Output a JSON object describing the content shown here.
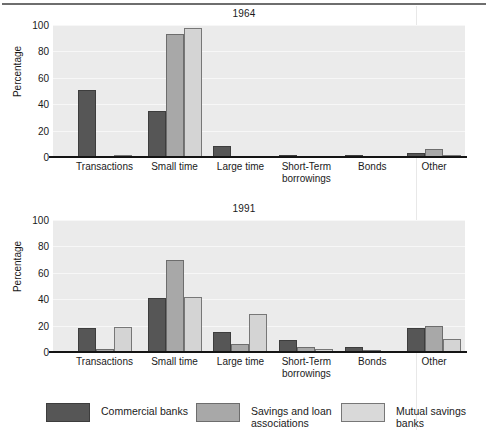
{
  "chart_data": [
    {
      "type": "bar",
      "title": "1964",
      "xlabel": "",
      "ylabel": "Percentage",
      "ylim": [
        0,
        100
      ],
      "yticks": [
        0,
        20,
        40,
        60,
        80,
        100
      ],
      "grid": true,
      "legend_position": "bottom",
      "categories": [
        "Transactions",
        "Small time",
        "Large time",
        "Short-Term borrowings",
        "Bonds",
        "Other"
      ],
      "series": [
        {
          "name": "Commercial banks",
          "color": "#565656",
          "values": [
            51,
            35,
            8.5,
            0.6,
            0.8,
            3
          ]
        },
        {
          "name": "Savings and loan associations",
          "color": "#a8a8a8",
          "values": [
            0,
            93,
            0,
            0,
            0,
            6
          ]
        },
        {
          "name": "Mutual savings banks",
          "color": "#d4d4d4",
          "values": [
            1,
            98,
            0,
            0,
            0,
            1.5
          ]
        }
      ]
    },
    {
      "type": "bar",
      "title": "1991",
      "xlabel": "",
      "ylabel": "Percentage",
      "ylim": [
        0,
        100
      ],
      "yticks": [
        0,
        20,
        40,
        60,
        80,
        100
      ],
      "grid": true,
      "legend_position": "bottom",
      "categories": [
        "Transactions",
        "Small time",
        "Large time",
        "Short-Term borrowings",
        "Bonds",
        "Other"
      ],
      "series": [
        {
          "name": "Commercial banks",
          "color": "#565656",
          "values": [
            18,
            41,
            15,
            9,
            3.5,
            18.5
          ]
        },
        {
          "name": "Savings and loan associations",
          "color": "#a8a8a8",
          "values": [
            2.5,
            70,
            6,
            3.5,
            1.5,
            20
          ]
        },
        {
          "name": "Mutual savings banks",
          "color": "#d4d4d4",
          "values": [
            19,
            42,
            29,
            2.5,
            0,
            10
          ]
        }
      ]
    }
  ],
  "charts": [
    {
      "title": "1964",
      "ylabel": "Percentage",
      "yticks": [
        "100",
        "80",
        "60",
        "40",
        "20",
        "0"
      ],
      "xlabels": [
        "Transactions",
        "Small time",
        "Large time",
        "Short-Term\nborrowings",
        "Bonds",
        "Other"
      ]
    },
    {
      "title": "1991",
      "ylabel": "Percentage",
      "yticks": [
        "100",
        "80",
        "60",
        "40",
        "20",
        "0"
      ],
      "xlabels": [
        "Transactions",
        "Small time",
        "Large time",
        "Short-Term\nborrowings",
        "Bonds",
        "Other"
      ]
    }
  ],
  "legend": {
    "items": [
      {
        "label": "Commercial banks",
        "color": "#565656"
      },
      {
        "label": "Savings and loan\nassociations",
        "color": "#a8a8a8"
      },
      {
        "label": "Mutual savings banks",
        "color": "#d9d9d9"
      }
    ]
  }
}
